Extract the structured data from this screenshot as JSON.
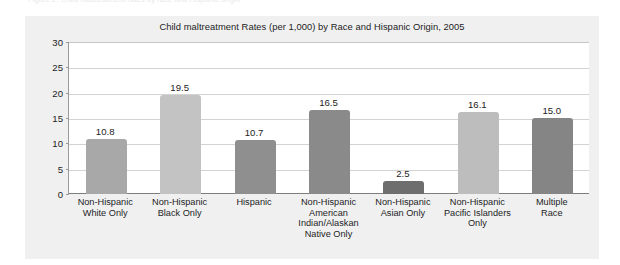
{
  "top_sliver": {
    "text": "Figure 2. Child maltreatment rates by race and Hispanic origin"
  },
  "chart_data": {
    "type": "bar",
    "title": "Child maltreatment Rates (per 1,000) by Race and Hispanic Origin, 2005",
    "xlabel": "",
    "ylabel": "",
    "ylim": [
      0,
      30
    ],
    "yticks": [
      0,
      5,
      10,
      15,
      20,
      25,
      30
    ],
    "ytick_labels": [
      "0",
      "5",
      "10",
      "15",
      "20",
      "25",
      "30"
    ],
    "grid": "horizontal",
    "legend": "none",
    "categories": [
      "Non-Hispanic\nWhite Only",
      "Non-Hispanic\nBlack Only",
      "Hispanic",
      "Non-Hispanic\nAmerican\nIndian/Alaskan\nNative Only",
      "Non-Hispanic\nAsian Only",
      "Non-Hispanic\nPacific Islanders\nOnly",
      "Multiple\nRace"
    ],
    "values": [
      10.8,
      19.5,
      10.7,
      16.5,
      2.5,
      16.1,
      15.0
    ],
    "value_labels": [
      "10.8",
      "19.5",
      "10.7",
      "16.5",
      "2.5",
      "16.1",
      "15.0"
    ],
    "bar_colors": [
      "#a8a8a8",
      "#c3c3c3",
      "#8f8f8f",
      "#8a8a8a",
      "#6e6e6e",
      "#bdbdbd",
      "#858585"
    ]
  },
  "categories_lines": [
    [
      "Non-Hispanic",
      "White Only"
    ],
    [
      "Non-Hispanic",
      "Black Only"
    ],
    [
      "Hispanic"
    ],
    [
      "Non-Hispanic",
      "American",
      "Indian/Alaskan",
      "Native Only"
    ],
    [
      "Non-Hispanic",
      "Asian Only"
    ],
    [
      "Non-Hispanic",
      "Pacific Islanders",
      "Only"
    ],
    [
      "Multiple",
      "Race"
    ]
  ],
  "colors": {
    "panel_background": "#f0f0f1",
    "plot_background": "#ffffff",
    "gridline": "#d3d3d6",
    "axis": "#7d7d80",
    "text": "#1d1d1d"
  }
}
